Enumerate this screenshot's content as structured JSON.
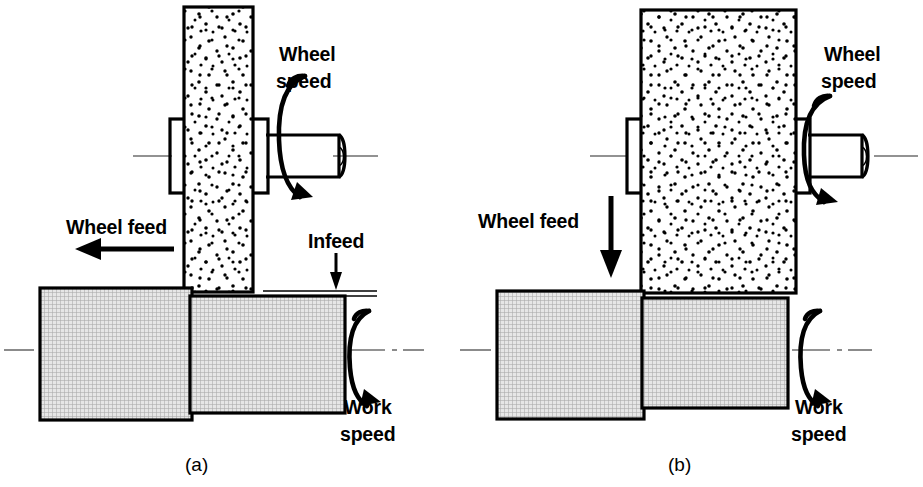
{
  "figure": {
    "title_visible": false,
    "background_color": "#ffffff",
    "line_color": "#000000",
    "workpiece_fill": "#d4d4d4",
    "wheel_fill": "#ffffff",
    "centerline_color": "#6e6e6e"
  },
  "panels": [
    {
      "id": "a",
      "caption": "(a)",
      "process_name": "traverse-grinding",
      "labels": {
        "wheel_speed_line1": "Wheel",
        "wheel_speed_line2": "speed",
        "wheel_feed": "Wheel feed",
        "infeed": "Infeed",
        "work_speed_line1": "Work",
        "work_speed_line2": "speed"
      },
      "wheel_feed_direction": "left",
      "wheel_speed_direction": "clockwise",
      "work_speed_direction": "clockwise",
      "has_infeed_dimension": true
    },
    {
      "id": "b",
      "caption": "(b)",
      "process_name": "plunge-grinding",
      "labels": {
        "wheel_speed_line1": "Wheel",
        "wheel_speed_line2": "speed",
        "wheel_feed": "Wheel feed",
        "work_speed_line1": "Work",
        "work_speed_line2": "speed"
      },
      "wheel_feed_direction": "down",
      "wheel_speed_direction": "clockwise",
      "work_speed_direction": "clockwise",
      "has_infeed_dimension": false
    }
  ],
  "caption_positions": {
    "a_x": 185,
    "a_y": 468,
    "b_x": 668,
    "b_y": 468
  }
}
